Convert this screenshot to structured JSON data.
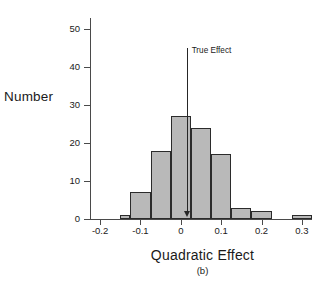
{
  "chart_data": {
    "type": "bar",
    "title": "",
    "xlabel": "Quadratic Effect",
    "ylabel": "Number",
    "caption": "(b)",
    "grid": false,
    "legend": "none",
    "xlim": [
      -0.225,
      0.325
    ],
    "ylim": [
      0,
      52
    ],
    "bin_width": 0.025,
    "xticks": [
      -0.2,
      -0.1,
      0,
      0.1,
      0.2,
      0.3
    ],
    "xtick_labels": [
      "-0.2",
      "-0.1",
      "0",
      "0.1",
      "0.2",
      "0.3"
    ],
    "yticks": [
      0,
      10,
      20,
      30,
      40,
      50
    ],
    "ytick_labels": [
      "0",
      "10",
      "20",
      "30",
      "40",
      "50"
    ],
    "bins": [
      {
        "left": -0.15,
        "right": -0.125,
        "value": 1
      },
      {
        "left": -0.125,
        "right": -0.075,
        "value": 7
      },
      {
        "left": -0.075,
        "right": -0.025,
        "value": 18
      },
      {
        "left": -0.025,
        "right": 0.025,
        "value": 27
      },
      {
        "left": 0.025,
        "right": 0.075,
        "value": 24
      },
      {
        "left": 0.075,
        "right": 0.125,
        "value": 17
      },
      {
        "left": 0.125,
        "right": 0.175,
        "value": 3
      },
      {
        "left": 0.175,
        "right": 0.225,
        "value": 2
      },
      {
        "left": 0.275,
        "right": 0.325,
        "value": 1
      }
    ],
    "annotations": [
      {
        "name": "true-effect",
        "label": "True Effect",
        "x": 0.017,
        "y_top": 45,
        "y_bottom": 2
      }
    ],
    "colors": {
      "bar_fill": "#b9b9b9",
      "bar_edge": "#2b2b2b",
      "axis": "#4a4a4a",
      "arrow": "#262626"
    }
  }
}
